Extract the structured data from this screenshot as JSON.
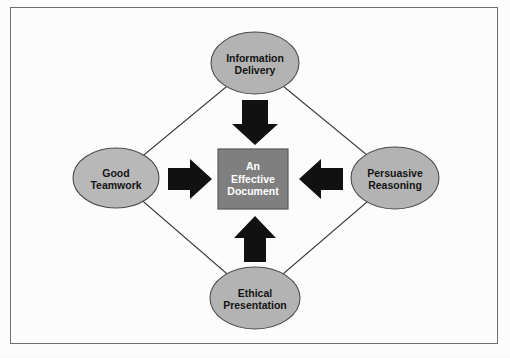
{
  "diagram": {
    "title_text": "",
    "center": {
      "id": "center-box",
      "label": "An\nEffective\nDocument",
      "shape": "rectangle",
      "fill": "#7f7f7f",
      "stroke": "#595959",
      "text_color": "#ffffff",
      "x": 218,
      "y": 149,
      "width": 70,
      "height": 60
    },
    "nodes": [
      {
        "id": "information-delivery",
        "label": "Information\nDelivery",
        "position": "top",
        "shape": "ellipse",
        "fill": "#b3b3b3",
        "stroke": "#4a4a4a",
        "cx": 255,
        "cy": 63,
        "rx": 44,
        "ry": 31
      },
      {
        "id": "good-teamwork",
        "label": "Good\nTeamwork",
        "position": "left",
        "shape": "ellipse",
        "fill": "#b8b8b8",
        "stroke": "#4a4a4a",
        "cx": 116,
        "cy": 178,
        "rx": 43,
        "ry": 30
      },
      {
        "id": "persuasive-reasoning",
        "label": "Persuasive\nReasoning",
        "position": "right",
        "shape": "ellipse",
        "fill": "#b3b3b3",
        "stroke": "#4a4a4a",
        "cx": 395,
        "cy": 178,
        "rx": 44,
        "ry": 31
      },
      {
        "id": "ethical-presentation",
        "label": "Ethical\nPresentation",
        "position": "bottom",
        "shape": "ellipse",
        "fill": "#b3b3b3",
        "stroke": "#4a4a4a",
        "cx": 255,
        "cy": 298,
        "rx": 45,
        "ry": 31
      }
    ],
    "arrows": [
      {
        "id": "arrow-top-down",
        "direction": "down",
        "from": "information-delivery",
        "to": "center-box",
        "color": "#111111"
      },
      {
        "id": "arrow-left-right",
        "direction": "right",
        "from": "good-teamwork",
        "to": "center-box",
        "color": "#111111"
      },
      {
        "id": "arrow-right-left",
        "direction": "left",
        "from": "persuasive-reasoning",
        "to": "center-box",
        "color": "#111111"
      },
      {
        "id": "arrow-bottom-up",
        "direction": "up",
        "from": "ethical-presentation",
        "to": "center-box",
        "color": "#111111"
      }
    ],
    "connector": {
      "id": "diamond-outline",
      "shape": "diamond",
      "stroke": "#3a3a3a",
      "fill": "none",
      "vertices": [
        [
          255,
          63
        ],
        [
          395,
          178
        ],
        [
          255,
          298
        ],
        [
          116,
          178
        ]
      ]
    },
    "frame": {
      "id": "outer-frame",
      "stroke": "#6f6f6f",
      "x": 10,
      "y": 7,
      "width": 488,
      "height": 337
    },
    "background_color": "#fcfcfc"
  }
}
